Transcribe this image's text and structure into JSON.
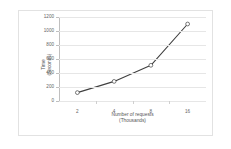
{
  "chart_data": {
    "type": "line",
    "title": "",
    "subtitle": "",
    "xlabel": "Number of requests\n(Thousands)",
    "xlabel_line1": "Number of requests",
    "xlabel_line2": "(Thousands)",
    "ylabel": "Time\n(Seconds)",
    "ylabel_line1": "Time",
    "ylabel_line2": "(Seconds)",
    "categories": [
      "2",
      "4",
      "8",
      "16"
    ],
    "x": [
      2,
      4,
      8,
      16
    ],
    "values": [
      120,
      280,
      510,
      1100
    ],
    "series": [
      {
        "name": "Time",
        "values": [
          120,
          280,
          510,
          1100
        ]
      }
    ],
    "ylim": [
      0,
      1200
    ],
    "ytick_values": [
      0,
      200,
      400,
      600,
      800,
      1000,
      1200
    ],
    "ytick_labels": [
      "0",
      "200",
      "400",
      "600",
      "800",
      "1000",
      "1200"
    ],
    "xtick_labels": [
      "2",
      "4",
      "8",
      "16"
    ],
    "grid": true,
    "grid_axis": "y",
    "legend": false,
    "legend_position": "none",
    "marker": "open-circle",
    "line_color": "#3f3f3f",
    "marker_fill": "#ffffff",
    "grid_color": "#e6e6e6",
    "axis_color": "#bfbfbf",
    "background": "#ffffff",
    "frame_border_color": "#e2e2e2"
  }
}
